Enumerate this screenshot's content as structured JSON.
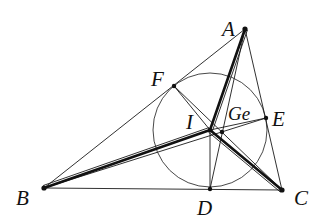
{
  "diagram": {
    "background": "#ffffff",
    "stroke_color": "#111111",
    "points": {
      "A": {
        "x": 245,
        "y": 29
      },
      "B": {
        "x": 44,
        "y": 188
      },
      "C": {
        "x": 282,
        "y": 190
      },
      "D": {
        "x": 210,
        "y": 189
      },
      "E": {
        "x": 266,
        "y": 118
      },
      "F": {
        "x": 174,
        "y": 86
      },
      "I": {
        "x": 210,
        "y": 130
      },
      "Ge": {
        "x": 222,
        "y": 132
      }
    },
    "incircle": {
      "cx": 210,
      "cy": 130,
      "r": 57
    },
    "labels": {
      "A": {
        "text": "A",
        "x": 222,
        "y": 36
      },
      "B": {
        "text": "B",
        "x": 16,
        "y": 205
      },
      "C": {
        "text": "C",
        "x": 294,
        "y": 205
      },
      "D": {
        "text": "D",
        "x": 197,
        "y": 215
      },
      "E": {
        "text": "E",
        "x": 272,
        "y": 126
      },
      "F": {
        "text": "F",
        "x": 151,
        "y": 86
      },
      "I": {
        "text": "I",
        "x": 186,
        "y": 129
      },
      "Ge": {
        "text": "Ge",
        "x": 228,
        "y": 120
      }
    },
    "segments": {
      "triangle_sides": [
        "AB",
        "BC",
        "CA"
      ],
      "cevians": [
        "AD",
        "BE",
        "CF"
      ],
      "radii": [
        "IF",
        "IE",
        "ID"
      ],
      "bold_bisectors": [
        "IA",
        "IB",
        "IC"
      ]
    }
  }
}
